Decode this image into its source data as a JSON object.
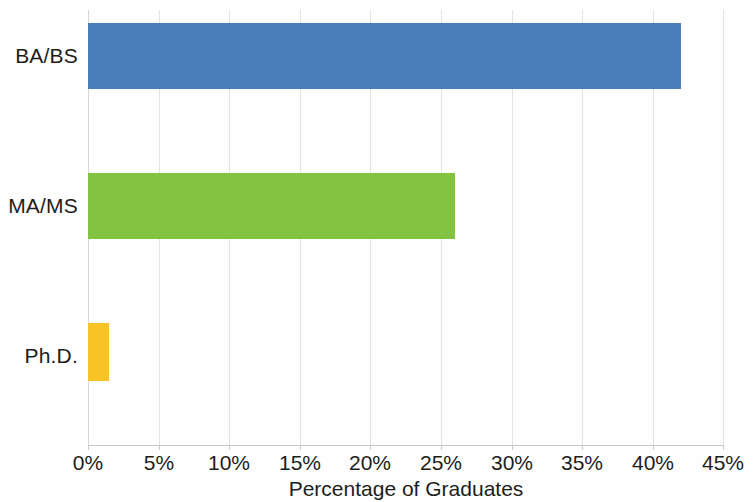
{
  "chart_data": {
    "type": "bar",
    "orientation": "horizontal",
    "title": "",
    "subtitle": "",
    "categories": [
      "BA/BS",
      "MA/MS",
      "Ph.D."
    ],
    "values": [
      42,
      26,
      1.5
    ],
    "series": [
      {
        "name": "Percentage of Graduates",
        "values": [
          42,
          26,
          1.5
        ]
      }
    ],
    "bar_colors": [
      "#4a7ebb",
      "#84c341",
      "#f7c325"
    ],
    "xlabel": "Percentage of Graduates",
    "ylabel": "",
    "xlim": [
      0,
      45
    ],
    "xticks": [
      0,
      5,
      10,
      15,
      20,
      25,
      30,
      35,
      40,
      45
    ],
    "xtick_labels": [
      "0%",
      "5%",
      "10%",
      "15%",
      "20%",
      "25%",
      "30%",
      "35%",
      "40%",
      "45%"
    ],
    "grid": "vertical",
    "grid_color": "#e3e3e5",
    "legend": null,
    "legend_position": "none",
    "annotations": [],
    "bars": [
      {
        "category": "BA/BS",
        "value": 42,
        "value_label": "42%",
        "color": "#4a7ebb"
      },
      {
        "category": "MA/MS",
        "value": 26,
        "value_label": "26%",
        "color": "#84c341"
      },
      {
        "category": "Ph.D.",
        "value": 1.5,
        "value_label": "1.5%",
        "color": "#f7c325"
      }
    ]
  },
  "axis": {
    "x_title": "Percentage of Graduates"
  }
}
